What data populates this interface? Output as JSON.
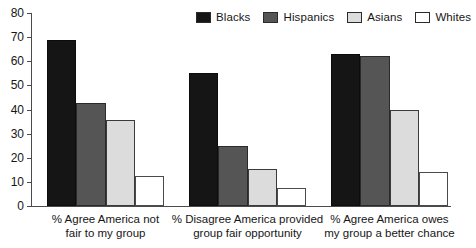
{
  "chart_data": {
    "type": "bar",
    "title": "",
    "subtitle": "",
    "xlabel": "",
    "ylabel": "",
    "ylim": [
      0,
      80
    ],
    "ytick_interval": 10,
    "yticks": [
      80,
      70,
      60,
      50,
      40,
      30,
      20,
      10,
      0
    ],
    "grid": false,
    "legend_position": "top-right",
    "categories": [
      "% Agree America not fair to my group",
      "% Disagree America provided group fair opportunity",
      "% Agree America owes my group a better chance"
    ],
    "category_lines": [
      [
        "% Agree America not",
        "fair to my group"
      ],
      [
        "% Disagree America provided",
        "group fair opportunity"
      ],
      [
        "% Agree America owes",
        "my group a better chance"
      ]
    ],
    "series": [
      {
        "name": "Blacks",
        "color": "#151515",
        "values": [
          69,
          55,
          63
        ]
      },
      {
        "name": "Hispanics",
        "color": "#555555",
        "values": [
          42.5,
          25,
          62
        ]
      },
      {
        "name": "Asians",
        "color": "#dcdcdc",
        "values": [
          35.5,
          15.5,
          40
        ]
      },
      {
        "name": "Whites",
        "color": "#ffffff",
        "values": [
          12.5,
          7.5,
          14
        ]
      }
    ]
  },
  "legend": {
    "items": [
      {
        "label": "Blacks",
        "swatch": "legend-swatch-blacks"
      },
      {
        "label": "Hispanics",
        "swatch": "legend-swatch-hispanics"
      },
      {
        "label": "Asians",
        "swatch": "legend-swatch-asians"
      },
      {
        "label": "Whites",
        "swatch": "legend-swatch-whites"
      }
    ]
  },
  "axis": {
    "y_tick_labels": [
      "80",
      "70",
      "60",
      "50",
      "40",
      "30",
      "20",
      "10",
      "0"
    ]
  }
}
